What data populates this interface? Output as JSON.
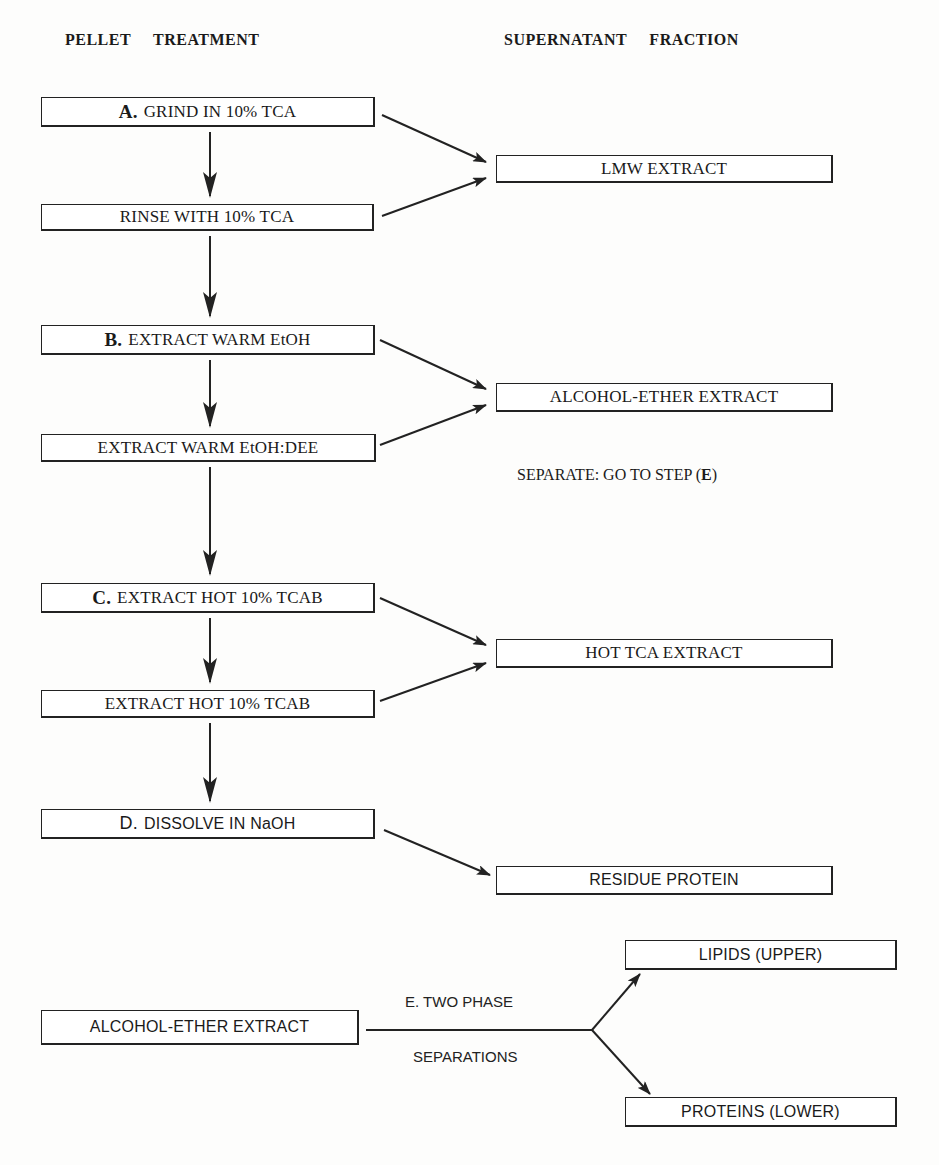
{
  "headers": {
    "left": "PELLET   TREATMENT",
    "right": "SUPERNATANT   FRACTION"
  },
  "pellet_steps": [
    {
      "id": "A",
      "step": "A.",
      "label": "GRIND IN 10% TCA"
    },
    {
      "id": "A2",
      "step": "",
      "label": "RINSE WITH 10% TCA"
    },
    {
      "id": "B",
      "step": "B.",
      "label": "EXTRACT WARM EtOH"
    },
    {
      "id": "B2",
      "step": "",
      "label": "EXTRACT WARM EtOH:DEE"
    },
    {
      "id": "C",
      "step": "C.",
      "label": "EXTRACT HOT 10% TCAB"
    },
    {
      "id": "C2",
      "step": "",
      "label": "EXTRACT HOT 10% TCAB"
    },
    {
      "id": "D",
      "step": "D.",
      "label": "DISSOLVE IN NaOH"
    }
  ],
  "supernatant_fractions": [
    {
      "id": "lmw",
      "label": "LMW EXTRACT"
    },
    {
      "id": "alcohol_ether",
      "label": "ALCOHOL-ETHER EXTRACT"
    },
    {
      "id": "hot_tca",
      "label": "HOT TCA EXTRACT"
    },
    {
      "id": "residue",
      "label": "RESIDUE PROTEIN"
    }
  ],
  "notes": {
    "separate_prefix": "SEPARATE:  GO TO STEP (",
    "separate_step": "E",
    "separate_suffix": ")"
  },
  "step_e": {
    "source": "ALCOHOL-ETHER EXTRACT",
    "label_top": "E.  TWO PHASE",
    "label_bottom": "SEPARATIONS",
    "upper_output": "LIPIDS (UPPER)",
    "lower_output": "PROTEINS (LOWER)"
  },
  "colors": {
    "line": "#222222",
    "background": "#fdfdfc"
  }
}
